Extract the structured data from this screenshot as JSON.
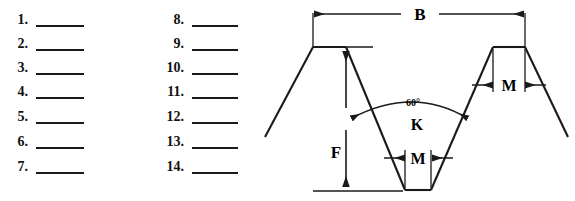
{
  "worksheet": {
    "columns": [
      {
        "id": "column-left",
        "items": [
          {
            "number": "1."
          },
          {
            "number": "2."
          },
          {
            "number": "3."
          },
          {
            "number": "4."
          },
          {
            "number": "5."
          },
          {
            "number": "6."
          },
          {
            "number": "7."
          }
        ]
      },
      {
        "id": "column-right",
        "items": [
          {
            "number": "8."
          },
          {
            "number": "9."
          },
          {
            "number": "10."
          },
          {
            "number": "11."
          },
          {
            "number": "12."
          },
          {
            "number": "13."
          },
          {
            "number": "14."
          }
        ]
      }
    ]
  },
  "diagram": {
    "type": "thread-profile-cross-section",
    "labels": {
      "pitch": "B",
      "depth": "F",
      "angle": "60°",
      "root_flat": "M",
      "crest_flat": "M",
      "root_region": "K"
    },
    "colors": {
      "line": "#1a1a1a",
      "background": "#ffffff"
    }
  }
}
